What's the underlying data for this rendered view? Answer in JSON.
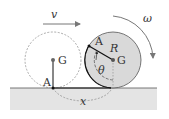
{
  "diagram": {
    "type": "physics-rolling-disk",
    "labels": {
      "velocity": "v",
      "angular_velocity": "ω",
      "point_left": "A",
      "center_left": "G",
      "point_right": "A",
      "radius": "R",
      "center_right": "G",
      "angle": "θ",
      "displacement": "x"
    },
    "colors": {
      "ground_fill": "#e4e4e4",
      "ground_line": "#555555",
      "disk_fill": "#d9d9d9",
      "disk_stroke": "#555555",
      "dashed": "#888888",
      "arrow": "#777777",
      "bold_line": "#111111",
      "center_dot": "#666666"
    }
  }
}
